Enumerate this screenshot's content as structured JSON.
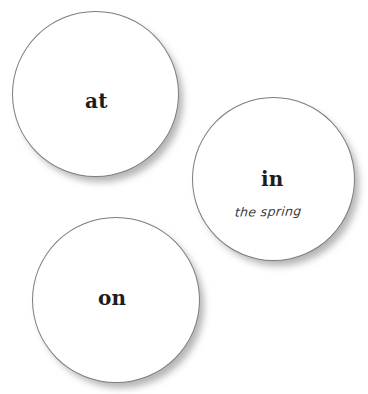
{
  "canvas": {
    "width": 368,
    "height": 394,
    "background_color": "#ffffff"
  },
  "style": {
    "circle_fill": "#ffffff",
    "circle_border_color": "#7d7d7d",
    "shadow_color": "#787878",
    "word_color": "#1d1d1d",
    "subtext_color": "#3a3a3a"
  },
  "circles": [
    {
      "id": "at",
      "word": "at",
      "subtext": "",
      "position": {
        "x": 12,
        "y": 11,
        "diameter": 167
      }
    },
    {
      "id": "in",
      "word": "in",
      "subtext": "the spring",
      "position": {
        "x": 192,
        "y": 97,
        "diameter": 163
      }
    },
    {
      "id": "on",
      "word": "on",
      "subtext": "",
      "position": {
        "x": 32,
        "y": 217,
        "diameter": 168
      }
    }
  ]
}
